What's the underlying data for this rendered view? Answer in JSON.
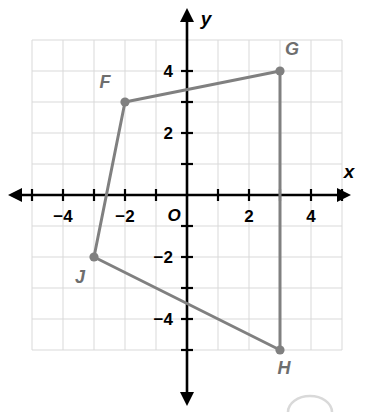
{
  "figure": {
    "background_color": "#ffffff"
  },
  "chart_data": {
    "type": "scatter",
    "title": "",
    "xlabel": "x",
    "ylabel": "y",
    "origin_label": "O",
    "xlim": [
      -5,
      5
    ],
    "ylim": [
      -6,
      5
    ],
    "grid": true,
    "grid_color": "#d9d9d9",
    "axis_color": "#000000",
    "series_color": "#808080",
    "x_tick_labels": [
      "−4",
      "−2",
      "2",
      "4"
    ],
    "x_tick_values": [
      -4,
      -2,
      2,
      4
    ],
    "y_tick_labels": [
      "4",
      "2",
      "−2",
      "−4"
    ],
    "y_tick_values": [
      4,
      2,
      -2,
      -4
    ],
    "minor_tick_values_x": [
      -5,
      -4,
      -3,
      -2,
      -1,
      1,
      2,
      3,
      4,
      5
    ],
    "minor_tick_values_y": [
      -5,
      -4,
      -3,
      -2,
      -1,
      1,
      2,
      3,
      4
    ],
    "points": [
      {
        "name": "F",
        "x": -2,
        "y": 3,
        "label": "F",
        "label_dx": -20,
        "label_dy": -14
      },
      {
        "name": "G",
        "x": 3,
        "y": 4,
        "label": "G",
        "label_dx": 12,
        "label_dy": -16
      },
      {
        "name": "H",
        "x": 3,
        "y": -5,
        "label": "H",
        "label_dx": 4,
        "label_dy": 24
      },
      {
        "name": "J",
        "x": -3,
        "y": -2,
        "label": "J",
        "label_dx": -14,
        "label_dy": 26
      }
    ],
    "polygon_order": [
      "F",
      "G",
      "H",
      "J"
    ],
    "polygon_closed": true,
    "series": [
      {
        "name": "Quadrilateral FGHJ",
        "x": [
          -2,
          3,
          3,
          -3
        ],
        "y": [
          3,
          4,
          -5,
          -2
        ]
      }
    ]
  }
}
